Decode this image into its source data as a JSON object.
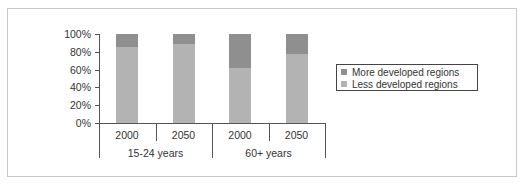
{
  "chart_data": {
    "type": "bar",
    "stacked": true,
    "normalized": true,
    "title": "",
    "xlabel": "",
    "ylabel": "",
    "ylim": [
      0,
      100
    ],
    "y_ticks": [
      "0%",
      "20%",
      "40%",
      "60%",
      "80%",
      "100%"
    ],
    "categories": [
      "2000",
      "2050",
      "2000",
      "2050"
    ],
    "category_groups": [
      {
        "label": "15-24 years",
        "categories": [
          "2000",
          "2050"
        ]
      },
      {
        "label": "60+ years",
        "categories": [
          "2000",
          "2050"
        ]
      }
    ],
    "series": [
      {
        "name": "Less developed regions",
        "color": "#b3b3b3",
        "values": [
          85,
          89,
          62,
          78
        ]
      },
      {
        "name": "More developed regions",
        "color": "#8f8f8f",
        "values": [
          15,
          11,
          38,
          22
        ]
      }
    ],
    "legend": {
      "position": "right",
      "entries": [
        "More developed regions",
        "Less developed regions"
      ]
    },
    "grid": false
  }
}
